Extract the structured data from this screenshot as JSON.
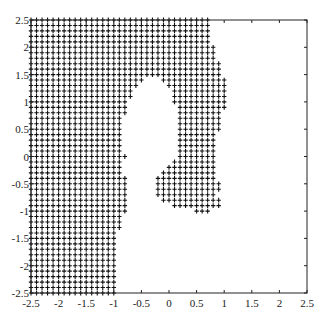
{
  "chart_data": {
    "type": "scatter",
    "title": "",
    "xlabel": "",
    "ylabel": "",
    "xlim": [
      -2.5,
      2.5
    ],
    "ylim": [
      -2.5,
      2.5
    ],
    "grid": false,
    "legend": null,
    "marker": "+",
    "marker_color": "#111111",
    "grid_step": 0.1,
    "xticks": [
      "-2.5",
      "-2",
      "-1.5",
      "-1",
      "-0.5",
      "0",
      "0.5",
      "1",
      "1.5",
      "2",
      "2.5"
    ],
    "yticks": [
      "2.5",
      "2",
      "1.5",
      "1",
      "0.5",
      "0",
      "-0.5",
      "-1",
      "-1.5",
      "-2",
      "-2.5"
    ],
    "rows": [
      {
        "y": 2.5,
        "intervals": [
          [
            -2.5,
            0.7
          ]
        ]
      },
      {
        "y": 2.4,
        "intervals": [
          [
            -2.5,
            0.7
          ]
        ]
      },
      {
        "y": 2.3,
        "intervals": [
          [
            -2.5,
            0.7
          ]
        ]
      },
      {
        "y": 2.2,
        "intervals": [
          [
            -2.5,
            0.7
          ]
        ]
      },
      {
        "y": 2.1,
        "intervals": [
          [
            -2.5,
            0.7
          ]
        ]
      },
      {
        "y": 2.0,
        "intervals": [
          [
            -2.5,
            0.8
          ]
        ]
      },
      {
        "y": 1.9,
        "intervals": [
          [
            -2.5,
            0.8
          ]
        ]
      },
      {
        "y": 1.8,
        "intervals": [
          [
            -2.5,
            0.8
          ]
        ]
      },
      {
        "y": 1.7,
        "intervals": [
          [
            -2.5,
            0.9
          ]
        ]
      },
      {
        "y": 1.6,
        "intervals": [
          [
            -2.5,
            0.9
          ]
        ]
      },
      {
        "y": 1.5,
        "intervals": [
          [
            -2.5,
            0.9
          ]
        ]
      },
      {
        "y": 1.4,
        "intervals": [
          [
            -2.5,
            -0.5
          ],
          [
            -0.1,
            1.0
          ]
        ]
      },
      {
        "y": 1.3,
        "intervals": [
          [
            -2.5,
            -0.6
          ],
          [
            0.0,
            1.0
          ]
        ]
      },
      {
        "y": 1.2,
        "intervals": [
          [
            -2.5,
            -0.7
          ],
          [
            0.1,
            1.0
          ]
        ]
      },
      {
        "y": 1.1,
        "intervals": [
          [
            -2.5,
            -0.7
          ],
          [
            0.1,
            1.0
          ]
        ]
      },
      {
        "y": 1.0,
        "intervals": [
          [
            -2.5,
            -0.8
          ],
          [
            0.1,
            1.0
          ]
        ]
      },
      {
        "y": 0.9,
        "intervals": [
          [
            -2.5,
            -0.8
          ],
          [
            0.2,
            1.0
          ]
        ]
      },
      {
        "y": 0.8,
        "intervals": [
          [
            -2.5,
            -0.8
          ],
          [
            0.2,
            0.9
          ]
        ]
      },
      {
        "y": 0.7,
        "intervals": [
          [
            -2.5,
            -0.9
          ],
          [
            0.2,
            0.9
          ]
        ]
      },
      {
        "y": 0.6,
        "intervals": [
          [
            -2.5,
            -0.9
          ],
          [
            0.2,
            0.9
          ]
        ]
      },
      {
        "y": 0.5,
        "intervals": [
          [
            -2.5,
            -0.9
          ],
          [
            0.2,
            0.9
          ]
        ]
      },
      {
        "y": 0.4,
        "intervals": [
          [
            -2.5,
            -0.9
          ],
          [
            0.2,
            0.8
          ]
        ]
      },
      {
        "y": 0.3,
        "intervals": [
          [
            -2.5,
            -0.9
          ],
          [
            0.2,
            0.8
          ]
        ]
      },
      {
        "y": 0.2,
        "intervals": [
          [
            -2.5,
            -0.9
          ],
          [
            0.2,
            0.8
          ]
        ]
      },
      {
        "y": 0.1,
        "intervals": [
          [
            -2.5,
            -0.9
          ],
          [
            0.2,
            0.8
          ]
        ]
      },
      {
        "y": 0.0,
        "intervals": [
          [
            -2.5,
            -0.8
          ],
          [
            0.2,
            0.8
          ]
        ]
      },
      {
        "y": -0.1,
        "intervals": [
          [
            -2.5,
            -0.9
          ],
          [
            0.1,
            0.8
          ]
        ]
      },
      {
        "y": -0.2,
        "intervals": [
          [
            -2.5,
            -0.9
          ],
          [
            0.0,
            0.8
          ]
        ]
      },
      {
        "y": -0.3,
        "intervals": [
          [
            -2.5,
            -0.9
          ],
          [
            -0.1,
            0.8
          ]
        ]
      },
      {
        "y": -0.4,
        "intervals": [
          [
            -2.5,
            -0.8
          ],
          [
            -0.2,
            0.8
          ]
        ]
      },
      {
        "y": -0.5,
        "intervals": [
          [
            -2.5,
            -0.8
          ],
          [
            -0.2,
            0.9
          ]
        ]
      },
      {
        "y": -0.6,
        "intervals": [
          [
            -2.5,
            -0.8
          ],
          [
            -0.2,
            0.9
          ]
        ]
      },
      {
        "y": -0.7,
        "intervals": [
          [
            -2.5,
            -0.8
          ],
          [
            -0.2,
            0.8
          ]
        ]
      },
      {
        "y": -0.8,
        "intervals": [
          [
            -2.5,
            -0.8
          ],
          [
            -0.1,
            0.9
          ]
        ]
      },
      {
        "y": -0.9,
        "intervals": [
          [
            -2.5,
            -0.8
          ],
          [
            0.1,
            0.9
          ]
        ]
      },
      {
        "y": -1.0,
        "intervals": [
          [
            -2.5,
            -0.8
          ],
          [
            0.5,
            0.7
          ]
        ]
      },
      {
        "y": -1.1,
        "intervals": [
          [
            -2.5,
            -0.9
          ]
        ]
      },
      {
        "y": -1.2,
        "intervals": [
          [
            -2.5,
            -0.9
          ]
        ]
      },
      {
        "y": -1.3,
        "intervals": [
          [
            -2.5,
            -0.9
          ]
        ]
      },
      {
        "y": -1.4,
        "intervals": [
          [
            -2.5,
            -1.0
          ]
        ]
      },
      {
        "y": -1.5,
        "intervals": [
          [
            -2.5,
            -1.0
          ]
        ]
      },
      {
        "y": -1.6,
        "intervals": [
          [
            -2.5,
            -1.0
          ]
        ]
      },
      {
        "y": -1.7,
        "intervals": [
          [
            -2.5,
            -1.0
          ]
        ]
      },
      {
        "y": -1.8,
        "intervals": [
          [
            -2.5,
            -1.0
          ]
        ]
      },
      {
        "y": -1.9,
        "intervals": [
          [
            -2.5,
            -1.0
          ]
        ]
      },
      {
        "y": -2.0,
        "intervals": [
          [
            -2.5,
            -1.0
          ]
        ]
      },
      {
        "y": -2.1,
        "intervals": [
          [
            -2.5,
            -1.0
          ]
        ]
      },
      {
        "y": -2.2,
        "intervals": [
          [
            -2.5,
            -1.0
          ]
        ]
      },
      {
        "y": -2.3,
        "intervals": [
          [
            -2.5,
            -1.0
          ]
        ]
      },
      {
        "y": -2.4,
        "intervals": [
          [
            -2.5,
            -1.0
          ]
        ]
      },
      {
        "y": -2.5,
        "intervals": [
          [
            -2.5,
            -1.0
          ]
        ]
      }
    ]
  }
}
